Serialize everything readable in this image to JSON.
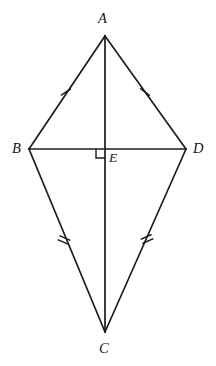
{
  "figure": {
    "type": "geometry-diagram",
    "shape": "kite",
    "width": 216,
    "height": 366,
    "background_color": "#ffffff",
    "stroke_color": "#1c1c1c",
    "label_color": "#161616"
  },
  "labels": {
    "A": "A",
    "B": "B",
    "C": "C",
    "D": "D",
    "E": "E"
  },
  "vertices": [
    {
      "name": "A",
      "x": 105,
      "y": 36,
      "label": "A",
      "label_position": "above"
    },
    {
      "name": "B",
      "x": 29,
      "y": 149,
      "label": "B",
      "label_position": "left"
    },
    {
      "name": "C",
      "x": 105,
      "y": 332,
      "label": "C",
      "label_position": "below"
    },
    {
      "name": "D",
      "x": 186,
      "y": 149,
      "label": "D",
      "label_position": "right"
    },
    {
      "name": "E",
      "x": 105,
      "y": 149,
      "label": "E",
      "label_position": "right"
    }
  ],
  "segments": [
    {
      "name": "AB",
      "from": "A",
      "to": "B",
      "x1": 105,
      "y1": 36,
      "x2": 29,
      "y2": 149,
      "tick_marks": 1
    },
    {
      "name": "AD",
      "from": "A",
      "to": "D",
      "x1": 105,
      "y1": 36,
      "x2": 186,
      "y2": 149,
      "tick_marks": 1
    },
    {
      "name": "BC",
      "from": "B",
      "to": "C",
      "x1": 29,
      "y1": 149,
      "x2": 105,
      "y2": 332,
      "tick_marks": 2
    },
    {
      "name": "CD",
      "from": "C",
      "to": "D",
      "x1": 105,
      "y1": 332,
      "x2": 186,
      "y2": 149,
      "tick_marks": 2
    },
    {
      "name": "AC",
      "from": "A",
      "to": "C",
      "x1": 105,
      "y1": 36,
      "x2": 105,
      "y2": 332,
      "tick_marks": 0
    },
    {
      "name": "BD",
      "from": "B",
      "to": "D",
      "x1": 29,
      "y1": 149,
      "x2": 186,
      "y2": 149,
      "tick_marks": 0
    }
  ],
  "tick_marks": [
    {
      "name": "tick-AB",
      "segment": "AB",
      "count": 1,
      "x": 66,
      "y": 92,
      "angle_deg": 56
    },
    {
      "name": "tick-AD",
      "segment": "AD",
      "count": 1,
      "x": 145,
      "y": 92,
      "angle_deg": -54
    },
    {
      "name": "tick-BC",
      "segment": "BC",
      "count": 2,
      "x": 64,
      "y": 240,
      "angle_deg": -67
    },
    {
      "name": "tick-CD",
      "segment": "CD",
      "count": 2,
      "x": 147,
      "y": 239,
      "angle_deg": 66
    }
  ],
  "right_angle": {
    "name": "right-angle-at-E",
    "at_vertex": "E",
    "x": 105,
    "y": 149,
    "size": 9,
    "quadrant": "lower-left",
    "measure": "90"
  }
}
